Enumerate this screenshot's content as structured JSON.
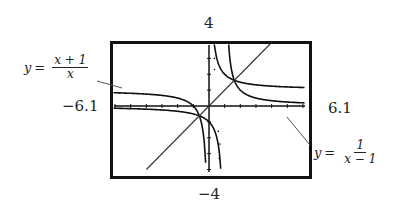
{
  "chart_data": {
    "type": "line",
    "title": "",
    "xlabel": "",
    "ylabel": "",
    "xlim": [
      -6.1,
      6.1
    ],
    "ylim": [
      -4,
      4
    ],
    "grid": false,
    "window_labels": {
      "ymax": "4",
      "ymin": "−4",
      "xmin": "−6.1",
      "xmax": "6.1"
    },
    "series": [
      {
        "name": "y = (x + 1)/x",
        "expression": "(x+1)/x",
        "asymptotes": {
          "vertical": 0,
          "horizontal": 1
        }
      },
      {
        "name": "y = 1/(x − 1)",
        "expression": "1/(x-1)",
        "asymptotes": {
          "vertical": 1,
          "horizontal": 0
        }
      },
      {
        "name": "y = x",
        "expression": "x"
      }
    ],
    "annotations": [
      {
        "text": "y = (x + 1)/x",
        "position": "upper-left, pointer to left branch"
      },
      {
        "text": "y = 1/(x − 1)",
        "position": "lower-right, pointer to right branch"
      }
    ]
  },
  "labels": {
    "ymax": "4",
    "ymin": "−4",
    "xmin": "−6.1",
    "xmax": "6.1"
  },
  "eq1": {
    "lhs": "y",
    "eqs": "=",
    "num": "x + 1",
    "den": "x"
  },
  "eq2": {
    "lhs": "y",
    "eqs": "=",
    "num": "1",
    "den": "x − 1"
  }
}
